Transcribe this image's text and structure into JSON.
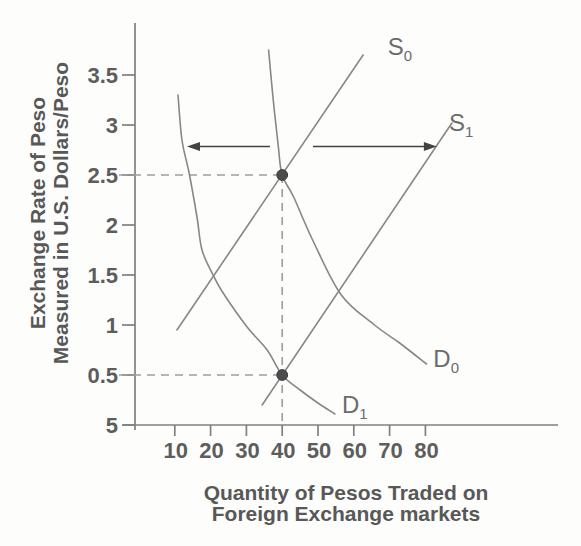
{
  "chart_data": {
    "type": "line",
    "title": "",
    "xlabel": "Quantity of Pesos Traded on Foreign Exchange markets",
    "ylabel": "Exchange Rate of Peso Measured in U.S. Dollars/Peso",
    "xlabel_lines": [
      "Quantity of Pesos Traded on",
      "Foreign Exchange markets"
    ],
    "ylabel_lines": [
      "Exchange Rate of Peso",
      "Measured in U.S. Dollars/Peso"
    ],
    "x_ticks": [
      10,
      20,
      30,
      40,
      50,
      60,
      70,
      80
    ],
    "y_ticks": [
      {
        "label": "3.5",
        "value": 3.5
      },
      {
        "label": "3",
        "value": 3.0
      },
      {
        "label": "2.5",
        "value": 2.5
      },
      {
        "label": "2",
        "value": 2.0
      },
      {
        "label": "1.5",
        "value": 1.5
      },
      {
        "label": "1",
        "value": 1.0
      },
      {
        "label": "0.5",
        "value": 0.5
      },
      {
        "label": "5",
        "value": 0.0
      }
    ],
    "xlim": [
      0,
      117
    ],
    "ylim": [
      0,
      4.0
    ],
    "grid": false,
    "legend_position": "none",
    "series": [
      {
        "name": "S0",
        "label": "S",
        "sub": "0",
        "kind": "supply",
        "shape": "straight",
        "points": [
          [
            10.6,
            0.95
          ],
          [
            62.6,
            3.7
          ]
        ],
        "label_at": [
          72.9,
          3.78
        ]
      },
      {
        "name": "S1",
        "label": "S",
        "sub": "1",
        "kind": "supply",
        "shape": "straight",
        "points": [
          [
            34.4,
            0.2
          ],
          [
            87.4,
            3.02
          ]
        ],
        "label_at": [
          90.0,
          3.02
        ]
      },
      {
        "name": "D0",
        "label": "D",
        "sub": "0",
        "kind": "demand",
        "shape": "curve",
        "points": [
          [
            36.2,
            3.75
          ],
          [
            37.5,
            3.25
          ],
          [
            38.9,
            2.79
          ],
          [
            40.0,
            2.5
          ],
          [
            43.2,
            2.28
          ],
          [
            48.5,
            1.85
          ],
          [
            56.5,
            1.3
          ],
          [
            65.8,
            1.0
          ],
          [
            72.8,
            0.82
          ],
          [
            80.3,
            0.61
          ]
        ],
        "label_at": [
          85.8,
          0.66
        ]
      },
      {
        "name": "D1",
        "label": "D",
        "sub": "1",
        "kind": "demand",
        "shape": "curve",
        "points": [
          [
            10.9,
            3.3
          ],
          [
            12.0,
            2.85
          ],
          [
            14.0,
            2.52
          ],
          [
            16.2,
            2.08
          ],
          [
            17.6,
            1.75
          ],
          [
            20.7,
            1.5
          ],
          [
            23.5,
            1.32
          ],
          [
            30.2,
            0.98
          ],
          [
            35.8,
            0.75
          ],
          [
            40.0,
            0.5
          ],
          [
            45.0,
            0.35
          ],
          [
            50.0,
            0.22
          ],
          [
            54.7,
            0.11
          ]
        ],
        "label_at": [
          60.3,
          0.2
        ]
      }
    ],
    "equilibria": [
      {
        "q": 40,
        "p": 2.5
      },
      {
        "q": 40,
        "p": 0.5
      }
    ],
    "guides": [
      {
        "type": "horizontal",
        "p": 2.5,
        "to_q": 40
      },
      {
        "type": "horizontal",
        "p": 0.5,
        "to_q": 40
      },
      {
        "type": "vertical",
        "q": 40,
        "from_p": 2.5,
        "to_p": 0
      }
    ],
    "arrows": [
      {
        "name": "demand-shift-left",
        "p": 2.785,
        "from_q": 36.6,
        "to_q": 13.4
      },
      {
        "name": "supply-shift-right",
        "p": 2.785,
        "from_q": 48.6,
        "to_q": 83.2
      }
    ],
    "colors": {
      "curve": "#878787",
      "axis": "#7f7f7f",
      "dot": "#4c4c4c",
      "dashed": "#9f9f9f",
      "arrow": "#434343",
      "tick_text": "#5d5d5d",
      "title_text": "#585858",
      "background": "#fdfdfc"
    }
  }
}
